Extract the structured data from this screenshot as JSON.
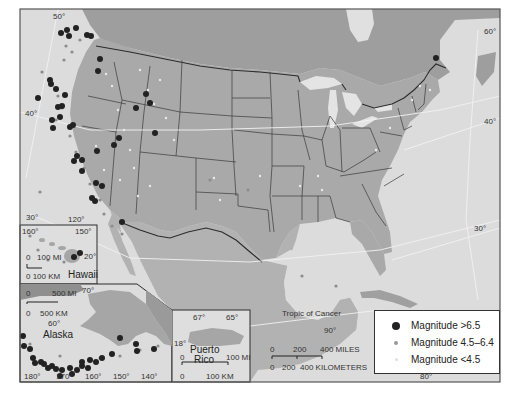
{
  "colors": {
    "ocean": "#dedede",
    "land_us": "#a8a8a8",
    "land_canada": "#9c9c9c",
    "land_mexico": "#b0b0b0",
    "border": "#333333",
    "water_lakes": "#e6e6e6",
    "quake_large": "#222222",
    "quake_mid": "#9a9a9a",
    "quake_small": "#e6e6e6"
  },
  "legend": {
    "items": [
      {
        "symbol": "large-dot",
        "label": "Magnitude >6.5"
      },
      {
        "symbol": "medium-dot",
        "label": "Magnitude 4.5–6.4"
      },
      {
        "symbol": "small-dot",
        "label": "Magnitude <4.5"
      }
    ]
  },
  "main_map": {
    "lat_labels": {
      "n50": "50°",
      "n40_west": "40°",
      "n30_west": "30°",
      "n60_east": "60°",
      "n40_east": "40°",
      "n30_east": "30°"
    },
    "lon_labels": {
      "w120": "120°",
      "w90": "90°",
      "w80": "80°"
    },
    "tropic_label": "Tropic of Cancer",
    "scale": {
      "miles_0": "0",
      "miles_200": "200",
      "miles_400": "400 MILES",
      "km_0": "0",
      "km_200": "200",
      "km_400": "400 KILOMETERS"
    }
  },
  "hawaii_inset": {
    "name": "Hawaii",
    "lon_160": "160°",
    "lon_150": "150°",
    "lat_20": "20°",
    "scale_mi": "0   100 MI",
    "scale_km": "0 100 KM"
  },
  "alaska_inset": {
    "name": "Alaska",
    "lat_70": "70°",
    "lat_60": "60°",
    "scale_mi_0": "0",
    "scale_mi": "500 MI",
    "scale_km_0": "0",
    "scale_km": "500 KM",
    "lons": [
      "180°",
      "170°",
      "160°",
      "150°",
      "140°"
    ]
  },
  "puerto_rico_inset": {
    "name_line1": "Puerto",
    "name_line2": "Rico",
    "lon_67": "67°",
    "lon_65": "65°",
    "lat_18": "18°",
    "scale_mi_0": "0",
    "scale_mi": "100 MI",
    "scale_km_0": "0",
    "scale_km": "100 KM"
  }
}
